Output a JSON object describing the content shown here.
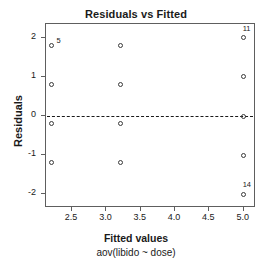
{
  "chart_data": {
    "type": "scatter",
    "title": "Residuals vs Fitted",
    "xlabel": "Fitted values",
    "xlabel_sub": "aov(libido ~ dose)",
    "ylabel": "Residuals",
    "xlim": [
      2.12,
      5.18
    ],
    "ylim": [
      -2.35,
      2.35
    ],
    "xticks": [
      2.5,
      3.0,
      3.5,
      4.0,
      4.5,
      5.0
    ],
    "xticklabels": [
      "2.5",
      "3.0",
      "3.5",
      "4.0",
      "4.5",
      "5.0"
    ],
    "yticks": [
      2,
      1,
      0,
      -1,
      -2
    ],
    "yticklabels": [
      "2",
      "1",
      "0",
      "-1",
      "-2"
    ],
    "grid": false,
    "legend": false,
    "reference_line": {
      "y": 0,
      "style": "dashed"
    },
    "points": [
      {
        "x": 2.2,
        "y": 1.8,
        "label": "5"
      },
      {
        "x": 2.2,
        "y": 0.8,
        "label": ""
      },
      {
        "x": 2.2,
        "y": -0.2,
        "label": ""
      },
      {
        "x": 2.2,
        "y": -1.2,
        "label": ""
      },
      {
        "x": 3.2,
        "y": 1.8,
        "label": ""
      },
      {
        "x": 3.2,
        "y": 0.8,
        "label": ""
      },
      {
        "x": 3.2,
        "y": -0.2,
        "label": ""
      },
      {
        "x": 3.2,
        "y": -1.2,
        "label": ""
      },
      {
        "x": 5.0,
        "y": 2.0,
        "label": "11"
      },
      {
        "x": 5.0,
        "y": 1.0,
        "label": ""
      },
      {
        "x": 5.0,
        "y": 0.0,
        "label": ""
      },
      {
        "x": 5.0,
        "y": -1.0,
        "label": ""
      },
      {
        "x": 5.0,
        "y": -2.0,
        "label": "14"
      }
    ],
    "point_label_offsets": {
      "5": {
        "dx": 5,
        "dy": -9
      },
      "11": {
        "dx": -1,
        "dy": -13
      },
      "14": {
        "dx": -1,
        "dy": -13
      }
    },
    "colors": {
      "point_stroke": "#3a3a3a",
      "axis": "#5e5e5e",
      "text": "#1a1a1a",
      "background": "#ffffff"
    }
  }
}
